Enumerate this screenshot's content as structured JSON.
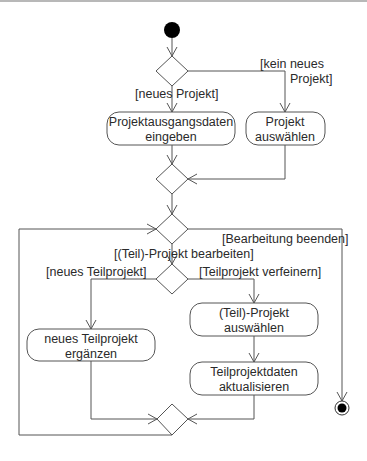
{
  "diagram": {
    "type": "UML activity diagram",
    "language": "German",
    "nodes": {
      "start": {
        "kind": "initial-node"
      },
      "decision_project": {
        "kind": "decision"
      },
      "action_enter_data": {
        "kind": "action",
        "line1": "Projektausgangsdaten",
        "line2": "eingeben"
      },
      "action_select_project": {
        "kind": "action",
        "line1": "Projekt",
        "line2": "auswählen"
      },
      "merge_project": {
        "kind": "merge"
      },
      "decision_edit": {
        "kind": "decision"
      },
      "decision_subproject": {
        "kind": "decision"
      },
      "action_add_subproject": {
        "kind": "action",
        "line1": "neues Teilprojekt",
        "line2": "ergänzen"
      },
      "action_select_subproject": {
        "kind": "action",
        "line1": "(Teil)-Projekt",
        "line2": "auswählen"
      },
      "action_update_data": {
        "kind": "action",
        "line1": "Teilprojektdaten",
        "line2": "aktualisieren"
      },
      "merge_subproject": {
        "kind": "merge"
      },
      "end": {
        "kind": "final-node"
      }
    },
    "guards": {
      "new_project": "[neues Projekt]",
      "no_new_project_line1": "[kein neues",
      "no_new_project_line2": "Projekt]",
      "end_editing": "[Bearbeitung beenden]",
      "edit_project": "[(Teil)-Projekt bearbeiten]",
      "new_subproject": "[neues Teilprojekt]",
      "refine_subproject": "[Teilprojekt verfeinern]"
    },
    "colors": {
      "stroke": "#555555",
      "text": "#2a2a2a",
      "fill": "#ffffff",
      "node_fill": "#000000"
    }
  }
}
